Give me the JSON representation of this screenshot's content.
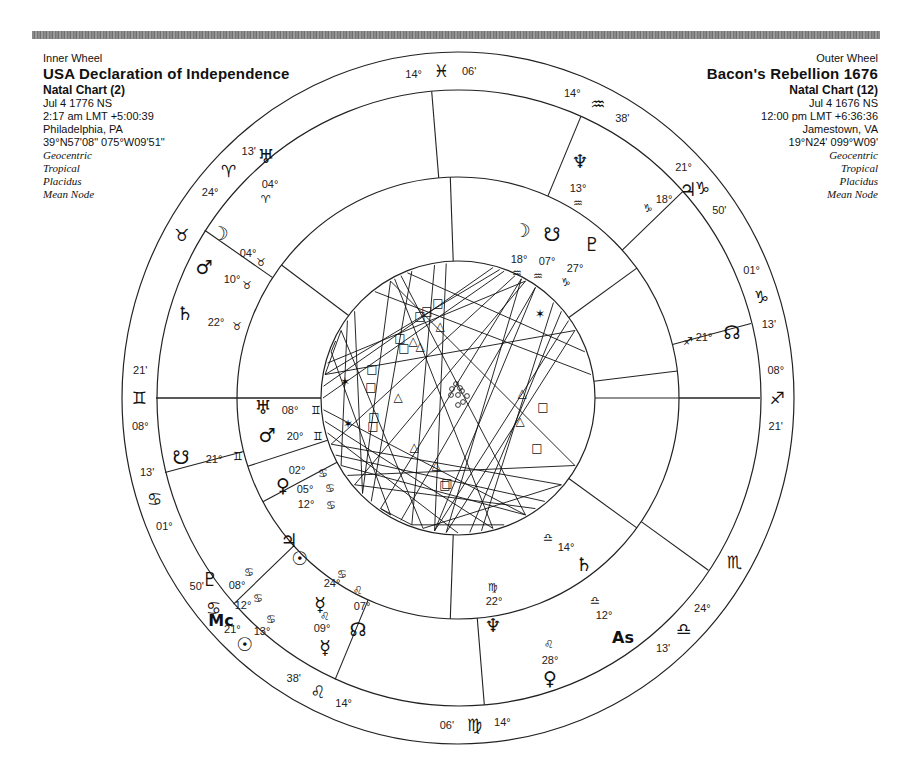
{
  "inner_wheel": {
    "label": "Inner Wheel",
    "name": "USA Declaration of Independence",
    "chart_type": "Natal Chart (2)",
    "date": "Jul 4 1776 NS",
    "time": "2:17 am  LMT +5:00:39",
    "place": "Philadelphia, PA",
    "coords": "39°N57'08\" 075°W09'51\"",
    "options": [
      "Geocentric",
      "Tropical",
      "Placidus",
      "Mean Node"
    ]
  },
  "outer_wheel": {
    "label": "Outer Wheel",
    "name": "Bacon's Rebellion 1676",
    "chart_type": "Natal Chart (12)",
    "date": "Jul 4 1676 NS",
    "time": "12:00 pm  LMT +6:36:36",
    "place": "Jamestown, VA",
    "coords": "19°N24' 099°W09'",
    "options": [
      "Geocentric",
      "Tropical",
      "Placidus",
      "Mean Node"
    ]
  },
  "chart_data": {
    "type": "bi-wheel astrology chart",
    "center": [
      458,
      398
    ],
    "rings": {
      "outer": [
        336,
        346
      ],
      "outer_cusp": [
        302,
        308
      ],
      "mid": [
        221,
        221
      ],
      "inner": [
        137,
        137
      ]
    },
    "outer_cusp_labels": [
      {
        "deg": "14°",
        "sign": "♓",
        "min": "06'",
        "angle": 93
      },
      {
        "deg": "14°",
        "sign": "♒",
        "min": "38'",
        "angle": 64
      },
      {
        "deg": "21°",
        "sign": "♑",
        "min": "50'",
        "angle": 40
      },
      {
        "deg": "01°",
        "sign": "♑",
        "min": "13'",
        "angle": 18
      },
      {
        "deg": "08°",
        "sign": "♐",
        "min": "21'",
        "angle": 0
      },
      {
        "deg": "",
        "sign": "♏",
        "min": "",
        "angle": -30
      },
      {
        "deg": "24°",
        "sign": "♎",
        "min": "13'",
        "angle": -45
      },
      {
        "deg": "14°",
        "sign": "♍",
        "min": "06'",
        "angle": -87
      },
      {
        "deg": "14°",
        "sign": "♌",
        "min": "38'",
        "angle": -116
      },
      {
        "deg": "21°",
        "sign": "♋",
        "min": "50'",
        "angle": -140
      },
      {
        "deg": "01°",
        "sign": "♋",
        "min": "13'",
        "angle": -162
      },
      {
        "deg": "08°",
        "sign": "♊",
        "min": "21'",
        "angle": 180
      },
      {
        "deg": "",
        "sign": "♉",
        "min": "",
        "angle": 150
      },
      {
        "deg": "24°",
        "sign": "♈",
        "min": "13'",
        "angle": 136
      }
    ],
    "outer_cusp_lines": [
      95,
      66,
      42,
      14,
      0,
      -34,
      -85,
      -114,
      -138,
      -166,
      180,
      147
    ],
    "inner_cusp_lines": [
      92,
      36,
      7,
      -36,
      -92,
      -152,
      -162,
      180,
      143
    ],
    "outer_planets": [
      {
        "glyph": "♅",
        "deg": "04°",
        "sign": "♈",
        "name": "Uranus"
      },
      {
        "glyph": "♆",
        "deg": "13°",
        "sign": "♒",
        "name": "Neptune"
      },
      {
        "glyph": "♃",
        "deg": "18°",
        "sign": "♑",
        "name": "Jupiter"
      },
      {
        "glyph": "☊",
        "deg": "21°",
        "sign": "♐",
        "name": "North Node"
      },
      {
        "glyph": "♄",
        "deg": "14°",
        "sign": "♎",
        "name": "Saturn"
      },
      {
        "glyph": "As",
        "deg": "12°",
        "sign": "♎",
        "name": "Ascendant"
      },
      {
        "glyph": "♀",
        "deg": "28°",
        "sign": "♌",
        "name": "Venus"
      },
      {
        "glyph": "☿",
        "deg": "09°",
        "sign": "♌",
        "name": "Mercury"
      },
      {
        "glyph": "☉",
        "deg": "13°",
        "sign": "♋",
        "name": "Sun"
      },
      {
        "glyph": "Mc",
        "deg": "12°",
        "sign": "♋",
        "name": "Midheaven"
      },
      {
        "glyph": "♇",
        "deg": "08°",
        "sign": "♋",
        "name": "Pluto"
      },
      {
        "glyph": "☋",
        "deg": "21°",
        "sign": "♊",
        "name": "South Node"
      },
      {
        "glyph": "♄",
        "deg": "22°",
        "sign": "♉",
        "name": "Saturn (inner ring)"
      },
      {
        "glyph": "♂",
        "deg": "10°",
        "sign": "♉",
        "name": "Mars"
      },
      {
        "glyph": "☽",
        "deg": "04°",
        "sign": "♉",
        "name": "Moon"
      }
    ],
    "inner_planets": [
      {
        "glyph": "☽",
        "deg": "18°",
        "sign": "♒",
        "name": "Moon"
      },
      {
        "glyph": "☋",
        "deg": "07°",
        "sign": "♒",
        "name": "South Node"
      },
      {
        "glyph": "♇",
        "deg": "27°",
        "sign": "♑",
        "name": "Pluto"
      },
      {
        "glyph": "♆",
        "deg": "22°",
        "sign": "♍",
        "name": "Neptune"
      },
      {
        "glyph": "☊",
        "deg": "07°",
        "sign": "♌",
        "name": "North Node"
      },
      {
        "glyph": "☿",
        "deg": "24°",
        "sign": "♋",
        "name": "Mercury"
      },
      {
        "glyph": "☉",
        "deg": "12°",
        "sign": "♋",
        "name": "Sun"
      },
      {
        "glyph": "♃",
        "deg": "05°",
        "sign": "♋",
        "name": "Jupiter"
      },
      {
        "glyph": "♀",
        "deg": "02°",
        "sign": "♋",
        "name": "Venus"
      },
      {
        "glyph": "♂",
        "deg": "20°",
        "sign": "♊",
        "name": "Mars"
      },
      {
        "glyph": "♅",
        "deg": "08°",
        "sign": "♊",
        "name": "Uranus"
      }
    ],
    "aspect_symbols": [
      "□",
      "△",
      "✶",
      "☌"
    ]
  }
}
